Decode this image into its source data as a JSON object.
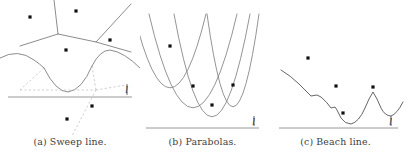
{
  "figure": {
    "background_color": "#ffffff",
    "stroke_color": "#6e6e6e",
    "dashed_color": "#b9b9b9",
    "point_color": "#111111",
    "baseline_color": "#8c8c8c",
    "caption_color": "#3d3d3d"
  },
  "panels": [
    {
      "id": "a",
      "caption": "(a) Sweep line.",
      "sweep_label": "l",
      "baseline_y": 97,
      "sites_above": [
        {
          "x": 30,
          "y": 17
        },
        {
          "x": 76,
          "y": 11
        },
        {
          "x": 110,
          "y": 40
        },
        {
          "x": 66,
          "y": 50
        }
      ],
      "sites_below": [
        {
          "x": 92,
          "y": 106
        },
        {
          "x": 67,
          "y": 119
        }
      ],
      "voronoi_solid_edges": [
        "M54,0 L58,34 L96,42 L131,4",
        "M58,34 L20,46",
        "M96,42 L131,52"
      ],
      "beach_arcs": [
        "M0,58 Q18,48 34,60 Q40,64 44,68",
        "M44,68 Q56,92 68,92 Q82,90 92,66",
        "M92,66 Q100,50 110,50 Q124,52 140,68"
      ],
      "dashed_edges": [
        "M44,68 L20,90",
        "M20,90 L96,90",
        "M92,66 L96,90",
        "M96,90 L126,85",
        "M96,90 L72,136"
      ]
    },
    {
      "id": "b",
      "caption": "(b) Parabolas.",
      "sweep_label": "l",
      "baseline_y": 128,
      "sites": [
        {
          "x": 30,
          "y": 46
        },
        {
          "x": 53,
          "y": 86
        },
        {
          "x": 72,
          "y": 105
        },
        {
          "x": 93,
          "y": 85
        }
      ],
      "parabolas": [
        {
          "vertex_x": 30,
          "vertex_y": 88,
          "half_width": 36,
          "top_y": 14
        },
        {
          "vertex_x": 53,
          "vertex_y": 108,
          "half_width": 44,
          "top_y": 14
        },
        {
          "vertex_x": 72,
          "vertex_y": 117,
          "half_width": 38,
          "top_y": 14
        },
        {
          "vertex_x": 93,
          "vertex_y": 107,
          "half_width": 26,
          "top_y": 14
        }
      ]
    },
    {
      "id": "c",
      "caption": "(c) Beach line.",
      "sweep_label": "l",
      "baseline_y": 128,
      "sites": [
        {
          "x": 43,
          "y": 58
        },
        {
          "x": 71,
          "y": 86
        },
        {
          "x": 78,
          "y": 113
        },
        {
          "x": 108,
          "y": 87
        }
      ],
      "beach_line": "M16,70 Q26,76 34,84 Q42,92 46,96 L52,95 L56,97 Q62,102 66,108 L70,107 L72,110 Q74,114 76,118 Q80,124 86,124 Q94,122 100,108 Q104,98 108,92 Q112,98 116,108 Q120,116 126,116 Q132,114 138,102"
    }
  ]
}
